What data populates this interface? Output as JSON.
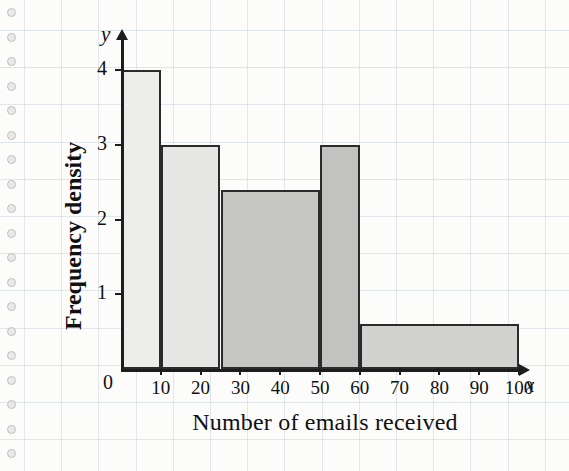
{
  "page": {
    "background_color": "#fcfcfb",
    "grid_color": "#c9d3dd",
    "ink_color": "#1d1d1d"
  },
  "axes": {
    "y_axis_name": "y",
    "x_axis_name": "x",
    "origin_label": "0"
  },
  "chart_data": {
    "type": "bar",
    "subtype": "histogram",
    "title": "",
    "xlabel": "Number of emails received",
    "ylabel": "Frequency density",
    "xlim": [
      0,
      100
    ],
    "ylim": [
      0,
      4
    ],
    "grid": true,
    "legend": "none",
    "x_ticks": [
      10,
      20,
      30,
      40,
      50,
      60,
      70,
      80,
      90,
      100
    ],
    "x_tick_labels": [
      "10",
      "20",
      "30",
      "40",
      "50",
      "60",
      "70",
      "80",
      "90",
      "100"
    ],
    "y_ticks": [
      1,
      2,
      3,
      4
    ],
    "y_tick_labels": [
      "1",
      "2",
      "3",
      "4"
    ],
    "bins": [
      {
        "label": "0-10",
        "x_start": 0,
        "x_end": 10,
        "frequency_density": 4,
        "fill_color": "#ededec"
      },
      {
        "label": "10-25",
        "x_start": 10,
        "x_end": 25,
        "frequency_density": 3,
        "fill_color": "#e6e6e4"
      },
      {
        "label": "25-50",
        "x_start": 25,
        "x_end": 50,
        "frequency_density": 2.4,
        "fill_color": "#c6c6c4"
      },
      {
        "label": "50-60",
        "x_start": 50,
        "x_end": 60,
        "frequency_density": 3,
        "fill_color": "#c2c2c0"
      },
      {
        "label": "60-100",
        "x_start": 60,
        "x_end": 100,
        "frequency_density": 0.6,
        "fill_color": "#d2d2d0"
      }
    ]
  }
}
